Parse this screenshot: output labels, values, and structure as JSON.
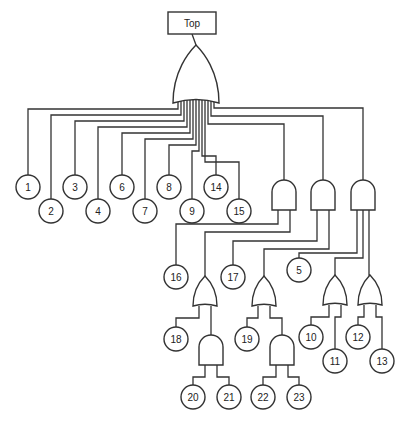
{
  "diagram": {
    "type": "fault-tree",
    "top_event": {
      "label": "Top",
      "x": 168,
      "y": 12,
      "w": 48,
      "h": 22
    },
    "colors": {
      "stroke": "#333333",
      "background": "#ffffff",
      "text": "#222222"
    },
    "gates": [
      {
        "id": "G0",
        "type": "OR",
        "x": 173,
        "y": 45,
        "w": 46,
        "h": 58,
        "parent": "Top"
      },
      {
        "id": "G1",
        "type": "AND",
        "x": 272,
        "y": 180,
        "w": 24,
        "h": 30,
        "parent": "G0"
      },
      {
        "id": "G2",
        "type": "AND",
        "x": 311,
        "y": 180,
        "w": 24,
        "h": 30,
        "parent": "G0"
      },
      {
        "id": "G3",
        "type": "AND",
        "x": 351,
        "y": 180,
        "w": 24,
        "h": 30,
        "parent": "G0"
      },
      {
        "id": "G4",
        "type": "OR",
        "x": 193,
        "y": 276,
        "w": 24,
        "h": 30,
        "parent": "G1"
      },
      {
        "id": "G5",
        "type": "OR",
        "x": 252,
        "y": 276,
        "w": 24,
        "h": 30,
        "parent": "G2"
      },
      {
        "id": "G6",
        "type": "OR",
        "x": 323,
        "y": 275,
        "w": 24,
        "h": 30,
        "parent": "G3"
      },
      {
        "id": "G7",
        "type": "OR",
        "x": 358,
        "y": 275,
        "w": 24,
        "h": 30,
        "parent": "G3"
      },
      {
        "id": "G8",
        "type": "AND",
        "x": 199,
        "y": 335,
        "w": 24,
        "h": 30,
        "parent": "G4"
      },
      {
        "id": "G9",
        "type": "AND",
        "x": 270,
        "y": 335,
        "w": 24,
        "h": 30,
        "parent": "G5"
      }
    ],
    "events": [
      {
        "label": "1",
        "cx": 28,
        "cy": 187,
        "parent": "G0"
      },
      {
        "label": "2",
        "cx": 51,
        "cy": 211,
        "parent": "G0"
      },
      {
        "label": "3",
        "cx": 75,
        "cy": 187,
        "parent": "G0"
      },
      {
        "label": "4",
        "cx": 98,
        "cy": 211,
        "parent": "G0"
      },
      {
        "label": "6",
        "cx": 122,
        "cy": 187,
        "parent": "G0"
      },
      {
        "label": "7",
        "cx": 145,
        "cy": 211,
        "parent": "G0"
      },
      {
        "label": "8",
        "cx": 169,
        "cy": 187,
        "parent": "G0"
      },
      {
        "label": "9",
        "cx": 192,
        "cy": 211,
        "parent": "G0"
      },
      {
        "label": "14",
        "cx": 216,
        "cy": 187,
        "parent": "G0"
      },
      {
        "label": "15",
        "cx": 239,
        "cy": 211,
        "parent": "G0"
      },
      {
        "label": "16",
        "cx": 176,
        "cy": 277,
        "parent": "G1"
      },
      {
        "label": "17",
        "cx": 233,
        "cy": 277,
        "parent": "G2"
      },
      {
        "label": "5",
        "cx": 299,
        "cy": 270,
        "parent": "G3"
      },
      {
        "label": "18",
        "cx": 176,
        "cy": 339,
        "parent": "G4"
      },
      {
        "label": "19",
        "cx": 247,
        "cy": 339,
        "parent": "G5"
      },
      {
        "label": "10",
        "cx": 311,
        "cy": 337,
        "parent": "G6"
      },
      {
        "label": "11",
        "cx": 335,
        "cy": 361,
        "parent": "G6"
      },
      {
        "label": "12",
        "cx": 358,
        "cy": 337,
        "parent": "G7"
      },
      {
        "label": "13",
        "cx": 382,
        "cy": 361,
        "parent": "G7"
      },
      {
        "label": "20",
        "cx": 193,
        "cy": 397,
        "parent": "G8"
      },
      {
        "label": "21",
        "cx": 229,
        "cy": 397,
        "parent": "G8"
      },
      {
        "label": "22",
        "cx": 263,
        "cy": 397,
        "parent": "G9"
      },
      {
        "label": "23",
        "cx": 299,
        "cy": 397,
        "parent": "G9"
      }
    ],
    "event_radius": 12
  }
}
